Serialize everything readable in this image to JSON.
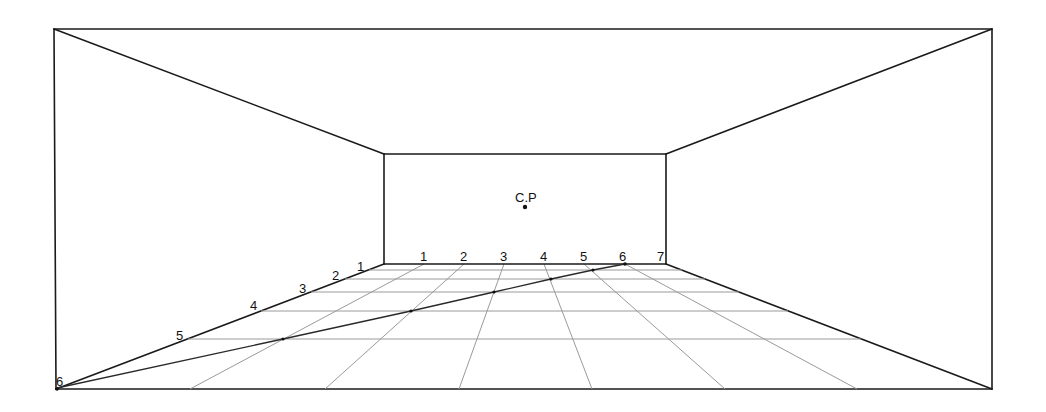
{
  "diagram": {
    "center_point_label": "C.P",
    "colors": {
      "edge": "#1a1a1a",
      "grid": "#9a9a9a",
      "background": "#ffffff"
    },
    "outer_frame": {
      "tl": [
        54,
        29
      ],
      "tr": [
        992,
        29
      ],
      "br": [
        992,
        389
      ],
      "bl": [
        56,
        389
      ]
    },
    "back_wall": {
      "tl": [
        384,
        154
      ],
      "tr": [
        666,
        154
      ],
      "br": [
        666,
        264
      ],
      "bl": [
        384,
        264
      ]
    },
    "center_point": [
      525,
      207
    ],
    "back_edge_labels": [
      "1",
      "2",
      "3",
      "4",
      "5",
      "6",
      "7"
    ],
    "back_edge_ticks_x": [
      424,
      464,
      504,
      544,
      584,
      625,
      666
    ],
    "left_edge_labels": [
      "1",
      "2",
      "3",
      "4",
      "5",
      "6"
    ],
    "left_edge_label_positions": [
      [
        358,
        271
      ],
      [
        333,
        280
      ],
      [
        300,
        293
      ],
      [
        251,
        310
      ],
      [
        177,
        340
      ],
      [
        57,
        387
      ]
    ],
    "horizontal_grid_y": [
      270,
      279,
      292,
      311,
      339
    ],
    "diagonal_points": [
      [
        625,
        264
      ],
      [
        593,
        270
      ],
      [
        551,
        279
      ],
      [
        494,
        292
      ],
      [
        411,
        311
      ],
      [
        283,
        339
      ],
      [
        57,
        388
      ]
    ]
  }
}
